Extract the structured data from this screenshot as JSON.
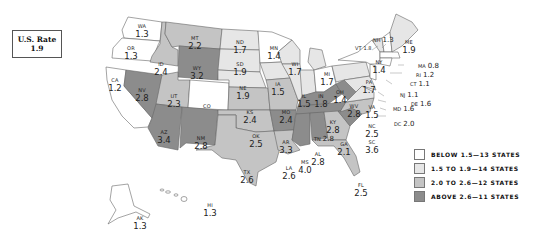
{
  "us_rate": {
    "title": "U.S. Rate",
    "value": "1.9"
  },
  "colors": {
    "below": "#ffffff",
    "low": "#e6e6e6",
    "mid": "#c4c4c4",
    "high": "#8c8c8c",
    "border": "#555555"
  },
  "legend": [
    {
      "label": "BELOW 1.5—13 STATES",
      "color": "#ffffff"
    },
    {
      "label": "1.5 TO 1.9—14 STATES",
      "color": "#e6e6e6"
    },
    {
      "label": "2.0 TO 2.6—12 STATES",
      "color": "#c4c4c4"
    },
    {
      "label": "ABOVE 2.6—11 STATES",
      "color": "#8c8c8c"
    }
  ],
  "states": {
    "WA": {
      "abbr": "WA",
      "value": "1.3"
    },
    "OR": {
      "abbr": "OR",
      "value": "1.3"
    },
    "CA": {
      "abbr": "CA",
      "value": "1.2"
    },
    "ID": {
      "abbr": "ID",
      "value": "2.4"
    },
    "NV": {
      "abbr": "NV",
      "value": "2.8"
    },
    "MT": {
      "abbr": "MT",
      "value": "2.2"
    },
    "WY": {
      "abbr": "WY",
      "value": "3.2"
    },
    "UT": {
      "abbr": "UT",
      "value": "2.3"
    },
    "CO": {
      "abbr": "CO",
      "value": ""
    },
    "AZ": {
      "abbr": "AZ",
      "value": "3.4"
    },
    "NM": {
      "abbr": "NM",
      "value": "2.8"
    },
    "ND": {
      "abbr": "ND",
      "value": "1.7"
    },
    "SD": {
      "abbr": "SD",
      "value": "1.9"
    },
    "NE": {
      "abbr": "NE",
      "value": "1.9"
    },
    "KS": {
      "abbr": "KS",
      "value": "2.4"
    },
    "OK": {
      "abbr": "OK",
      "value": "2.5"
    },
    "TX": {
      "abbr": "TX",
      "value": "2.6"
    },
    "MN": {
      "abbr": "MN",
      "value": "1.4"
    },
    "IA": {
      "abbr": "IA",
      "value": "1.5"
    },
    "MO": {
      "abbr": "MO",
      "value": "2.4"
    },
    "AR": {
      "abbr": "AR",
      "value": "3.3"
    },
    "LA": {
      "abbr": "LA",
      "value": "2.6"
    },
    "WI": {
      "abbr": "WI",
      "value": "1.7"
    },
    "IL": {
      "abbr": "IL",
      "value": "1.5"
    },
    "MI": {
      "abbr": "MI",
      "value": "1.7"
    },
    "IN": {
      "abbr": "IN",
      "value": "1.8"
    },
    "OH": {
      "abbr": "OH",
      "value": "1.4"
    },
    "KY": {
      "abbr": "KY",
      "value": "2.8"
    },
    "TN": {
      "abbr": "TN",
      "value": "2.8"
    },
    "MS": {
      "abbr": "MS",
      "value": "4.0"
    },
    "AL": {
      "abbr": "AL",
      "value": "2.8"
    },
    "GA": {
      "abbr": "GA",
      "value": "2.1"
    },
    "FL": {
      "abbr": "FL",
      "value": "2.5"
    },
    "SC": {
      "abbr": "SC",
      "value": "3.6"
    },
    "NC": {
      "abbr": "NC",
      "value": "2.5"
    },
    "VA": {
      "abbr": "VA",
      "value": "1.5"
    },
    "WV": {
      "abbr": "WV",
      "value": "2.8"
    },
    "PA": {
      "abbr": "PA",
      "value": "1.7"
    },
    "NY": {
      "abbr": "NY",
      "value": "1.4"
    },
    "VT": {
      "abbr": "VT",
      "value": "1.8"
    },
    "NH": {
      "abbr": "NH",
      "value": "1.3"
    },
    "ME": {
      "abbr": "ME",
      "value": "1.9"
    },
    "MA": {
      "abbr": "MA",
      "value": "0.8"
    },
    "RI": {
      "abbr": "RI",
      "value": "1.2"
    },
    "CT": {
      "abbr": "CT",
      "value": "1.1"
    },
    "NJ": {
      "abbr": "NJ",
      "value": "1.1"
    },
    "DE": {
      "abbr": "DE",
      "value": "1.6"
    },
    "MD": {
      "abbr": "MD",
      "value": "1.6"
    },
    "DC": {
      "abbr": "DC",
      "value": "2.0"
    },
    "AK": {
      "abbr": "AK",
      "value": "1.3"
    },
    "HI": {
      "abbr": "HI",
      "value": "1.3"
    }
  }
}
